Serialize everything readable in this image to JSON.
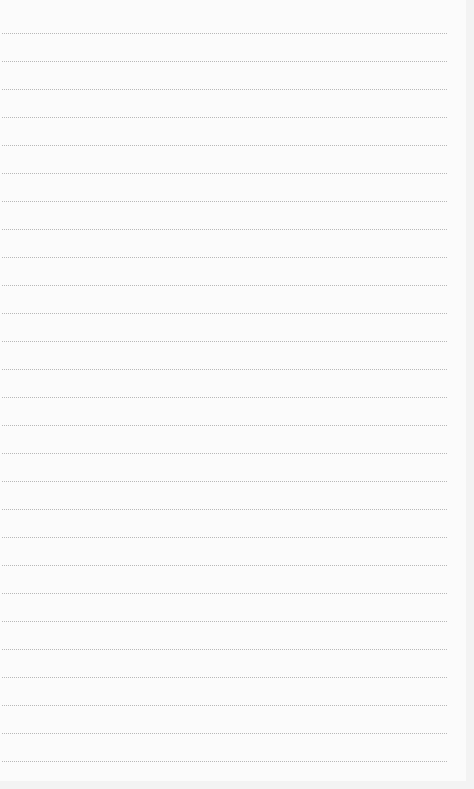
{
  "page": {
    "type": "lined-notepad",
    "background": "#fbfbfb",
    "line_color": "#b8b8b8",
    "line_count": 27,
    "first_line_y": 33,
    "line_spacing": 28,
    "lines": []
  }
}
